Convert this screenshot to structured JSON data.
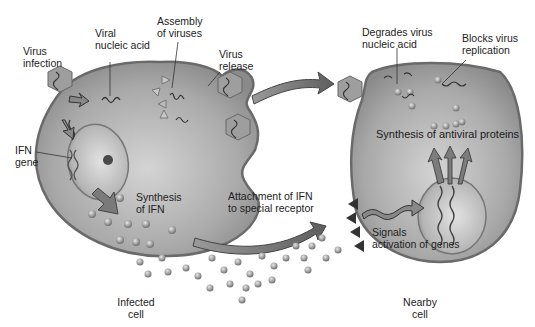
{
  "figure": {
    "topic": "Interferon (IFN) antiviral action",
    "colors": {
      "cell_fill": "#a8a8a8",
      "cell_edge": "#6e6e6e",
      "nucleus_fill": "#c4c4c4",
      "arrow_fill": "#7d7d7d",
      "virus_fill": "#9a9a9a",
      "ifn_particle": "#8e8e8e",
      "text": "#222222"
    }
  },
  "infected_cell": {
    "caption": "Infected\ncell",
    "labels": {
      "virus_infection": "Virus\ninfection",
      "viral_nucleic_acid": "Viral\nnucleic acid",
      "assembly_of_viruses": "Assembly\nof viruses",
      "virus_release": "Virus\nrelease",
      "ifn_gene": "IFN\ngene",
      "synthesis_of_ifn": "Synthesis\nof IFN"
    }
  },
  "transfer": {
    "attachment_label": "Attachment of IFN\nto special receptor"
  },
  "nearby_cell": {
    "caption": "Nearby\ncell",
    "labels": {
      "degrades_virus_nucleic_acid": "Degrades virus\nnucleic acid",
      "blocks_virus_replication": "Blocks virus\nreplication",
      "synthesis_of_antiviral_proteins": "Synthesis of antiviral proteins",
      "signals_activation_of_genes": "Signals\nactivation of genes"
    }
  }
}
